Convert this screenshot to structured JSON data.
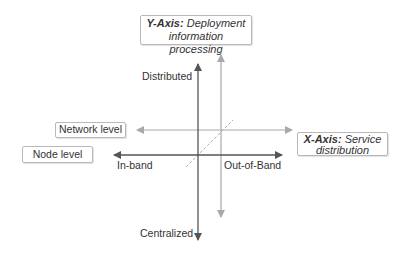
{
  "diagram": {
    "y_axis": {
      "title": "Y-Axis:",
      "description_line1": "Deployment",
      "description_line2": "information processing"
    },
    "x_axis": {
      "title": "X-Axis:",
      "description_line1": "Service",
      "description_line2": "distribution"
    },
    "levels": {
      "network": "Network level",
      "node": "Node level"
    },
    "poles": {
      "top": "Distributed",
      "bottom": "Centralized",
      "left": "In-band",
      "right": "Out-of-Band"
    },
    "colors": {
      "dark_axis": "#555555",
      "light_axis": "#a8a8a8",
      "box_border": "#b8b8b8"
    }
  }
}
